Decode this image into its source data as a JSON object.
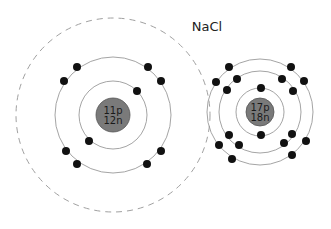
{
  "title": "NaCl",
  "atoms": [
    {
      "name": "sodium",
      "protons_label": "11p",
      "neutrons_label": "12n",
      "center": [
        113,
        115
      ],
      "nucleus_radius": 17,
      "shells": [
        34,
        58
      ],
      "dashed_shell": 97,
      "electrons": [
        [
          137,
          91
        ],
        [
          89,
          141
        ],
        [
          77,
          67
        ],
        [
          64,
          81
        ],
        [
          148,
          67
        ],
        [
          161,
          81
        ],
        [
          66,
          151
        ],
        [
          77,
          164
        ],
        [
          161,
          151
        ],
        [
          147,
          164
        ]
      ]
    },
    {
      "name": "chlorine",
      "protons_label": "17p",
      "neutrons_label": "18n",
      "center": [
        260,
        112
      ],
      "nucleus_radius": 14,
      "shells": [
        24,
        41,
        53
      ],
      "electrons": [
        [
          261,
          88
        ],
        [
          261,
          135
        ],
        [
          237,
          79
        ],
        [
          227,
          90
        ],
        [
          282,
          79
        ],
        [
          293,
          91
        ],
        [
          239,
          145
        ],
        [
          229,
          135
        ],
        [
          284,
          143
        ],
        [
          292,
          134
        ],
        [
          229,
          67
        ],
        [
          216,
          82
        ],
        [
          291,
          67
        ],
        [
          304,
          81
        ],
        [
          219,
          145
        ],
        [
          232,
          159
        ],
        [
          306,
          141
        ],
        [
          292,
          155
        ]
      ]
    }
  ],
  "colors": {
    "nucleus": "#7a7a7a",
    "electron": "#111111",
    "shell": "#9a9a9a"
  }
}
